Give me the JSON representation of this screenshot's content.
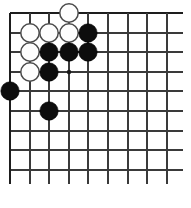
{
  "board": {
    "type": "go-board-diagram",
    "game": "Go",
    "visible_columns": 9,
    "visible_rows": 9,
    "colors": {
      "background": "#ffffff",
      "grid_line": "#3a3a3a",
      "edge_line": "#1d1d1d",
      "black_stone": "#0d0d0d",
      "white_stone": "#fdfdfd",
      "white_stone_outline": "#4a4a4a",
      "star_point": "#1a1a1a"
    },
    "geometry": {
      "origin_x": 10,
      "origin_y": 13,
      "spacing_x": 19.6,
      "spacing_y": 19.6,
      "stone_radius": 9.2,
      "star_point_radius": 2.2,
      "line_overhang_right": 16,
      "line_overhang_bottom": 14
    },
    "grid_lines": {
      "vertical_x": [
        10,
        30,
        49,
        69,
        88,
        108,
        128,
        147,
        167
      ],
      "horizontal_y": [
        13,
        33,
        52,
        72,
        91,
        111,
        131,
        150,
        170
      ],
      "top_edge_index": 0,
      "left_edge_index": 0
    },
    "star_points": [
      {
        "col": 4,
        "row": 4
      }
    ],
    "stones": [
      {
        "color": "white",
        "col": 4,
        "row": 1
      },
      {
        "color": "white",
        "col": 2,
        "row": 2
      },
      {
        "color": "white",
        "col": 3,
        "row": 2
      },
      {
        "color": "white",
        "col": 4,
        "row": 2
      },
      {
        "color": "black",
        "col": 5,
        "row": 2
      },
      {
        "color": "white",
        "col": 2,
        "row": 3
      },
      {
        "color": "black",
        "col": 3,
        "row": 3
      },
      {
        "color": "black",
        "col": 4,
        "row": 3
      },
      {
        "color": "black",
        "col": 5,
        "row": 3
      },
      {
        "color": "white",
        "col": 2,
        "row": 4
      },
      {
        "color": "black",
        "col": 3,
        "row": 4
      },
      {
        "color": "black",
        "col": 1,
        "row": 5
      },
      {
        "color": "black",
        "col": 3,
        "row": 6
      }
    ],
    "counts": {
      "black_stones": 7,
      "white_stones": 6,
      "total_stones": 13
    }
  }
}
